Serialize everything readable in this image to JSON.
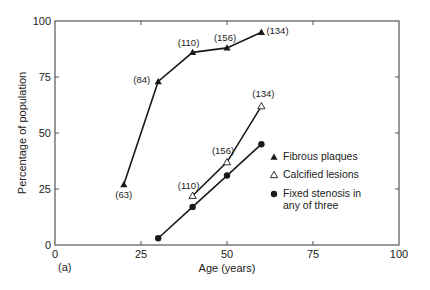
{
  "figure": {
    "panel_label": "(a)"
  },
  "chart_data": {
    "type": "line",
    "title": "",
    "xlabel": "Age (years)",
    "ylabel": "Percentage of population",
    "xlim": [
      0,
      100
    ],
    "ylim": [
      0,
      100
    ],
    "xticks": [
      0,
      25,
      50,
      75,
      100
    ],
    "yticks": [
      0,
      25,
      50,
      75,
      100
    ],
    "grid": false,
    "legend_position": "inside-right",
    "series": [
      {
        "name": "Fibrous plaques",
        "marker": "filled-triangle",
        "x": [
          20,
          30,
          40,
          50,
          60
        ],
        "values": [
          27,
          73,
          86,
          88,
          95
        ],
        "annotations": [
          "(63)",
          "(84)",
          "(110)",
          "(156)",
          "(134)"
        ]
      },
      {
        "name": "Calcified lesions",
        "marker": "open-triangle",
        "x": [
          40,
          50,
          60
        ],
        "values": [
          22,
          37,
          62
        ],
        "annotations": [
          "(110)",
          "(156)",
          "(134)"
        ]
      },
      {
        "name": "Fixed stenosis in any of three",
        "name_lines": [
          "Fixed stenosis in",
          "any of three"
        ],
        "marker": "filled-circle",
        "x": [
          30,
          40,
          50,
          60
        ],
        "values": [
          3,
          17,
          31,
          45
        ],
        "annotations": []
      }
    ]
  },
  "colors": {
    "axis": "#555555",
    "line": "#1a1a1a",
    "text": "#222222"
  }
}
